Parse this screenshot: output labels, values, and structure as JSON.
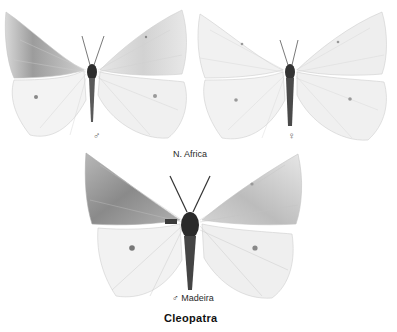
{
  "plate": {
    "title": "Cleopatra",
    "specimens": [
      {
        "id": "top-left",
        "sex_symbol": "♂",
        "sex": "male"
      },
      {
        "id": "top-right",
        "sex_symbol": "♀",
        "sex": "female"
      },
      {
        "id": "bottom",
        "sex_symbol": "♂",
        "sex": "male",
        "locality": "Madeira"
      }
    ],
    "top_row_locality": "N. Africa",
    "bottom_label": "♂  Madeira"
  },
  "colors": {
    "background": "#ffffff",
    "wing_light": "#f2f2f2",
    "wing_shade": "#9a9a9a",
    "body": "#2e2e2e",
    "text": "#222222"
  }
}
